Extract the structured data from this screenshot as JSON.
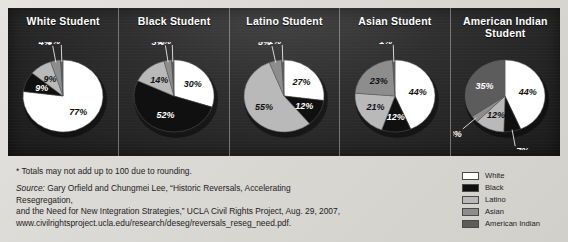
{
  "chart_data": {
    "type": "pie",
    "title": "",
    "categories": [
      "White",
      "Black",
      "Latino",
      "Asian",
      "American Indian"
    ],
    "colors": [
      "#ffffff",
      "#101010",
      "#b9b9b9",
      "#8d8d8d",
      "#5c5c5c"
    ],
    "charts": [
      {
        "title": "White Student",
        "values": [
          77,
          9,
          9,
          4,
          1
        ],
        "labels": [
          "77%",
          "9%",
          "9%",
          "4%",
          "1%"
        ]
      },
      {
        "title": "Black Student",
        "values": [
          30,
          52,
          14,
          3,
          1
        ],
        "labels": [
          "30%",
          "52%",
          "14%",
          "3%",
          "1%"
        ]
      },
      {
        "title": "Latino Student",
        "values": [
          27,
          12,
          55,
          5,
          1
        ],
        "labels": [
          "27%",
          "12%",
          "55%",
          "5%",
          "1%"
        ]
      },
      {
        "title": "Asian Student",
        "values": [
          44,
          12,
          21,
          23,
          1
        ],
        "labels": [
          "44%",
          "12%",
          "21%",
          "23%",
          "1%"
        ]
      },
      {
        "title": "American Indian Student",
        "values": [
          44,
          7,
          12,
          3,
          35
        ],
        "labels": [
          "44%",
          "7%",
          "12%",
          "3%",
          "35%"
        ]
      }
    ]
  },
  "panels": [
    {
      "title": "White Student"
    },
    {
      "title": "Black Student"
    },
    {
      "title": "Latino Student"
    },
    {
      "title": "Asian Student"
    },
    {
      "title": "American Indian Student"
    }
  ],
  "footnote": "* Totals may not add up to 100 due to rounding.",
  "source": {
    "label": "Source:",
    "line1": " Gary Orfield and Chungmei Lee, “Historic Reversals, Accelerating Resegregation,",
    "line2": "and the Need for New Integration Strategies,” UCLA Civil Rights Project, Aug. 29, 2007,",
    "line3": "www.civilrightsproject.ucla.edu/research/deseg/reversals_reseg_need.pdf."
  },
  "legend": {
    "items": [
      {
        "label": "White",
        "color": "#ffffff"
      },
      {
        "label": "Black",
        "color": "#101010"
      },
      {
        "label": "Latino",
        "color": "#b9b9b9"
      },
      {
        "label": "Asian",
        "color": "#8d8d8d"
      },
      {
        "label": "American Indian",
        "color": "#5c5c5c"
      }
    ]
  }
}
